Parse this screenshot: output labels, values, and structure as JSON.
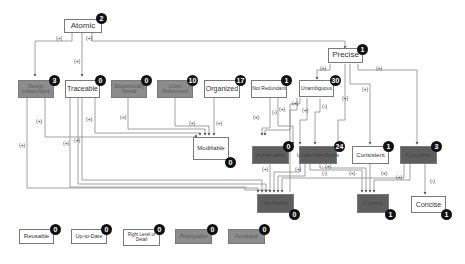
{
  "diagram": {
    "nodes": [
      {
        "id": "atomic",
        "label": "Atomic",
        "count": "2",
        "style": "white"
      },
      {
        "id": "precise",
        "label": "Precise",
        "count": "1",
        "style": "white"
      },
      {
        "id": "design_independent",
        "label": "Design Independent",
        "count": "3",
        "style": "gray"
      },
      {
        "id": "traceable",
        "label": "Traceable",
        "count": "0",
        "style": "white"
      },
      {
        "id": "electronically_stored",
        "label": "Electronically Stored",
        "count": "0",
        "style": "gray"
      },
      {
        "id": "cross_referenced",
        "label": "Cross Referenced",
        "count": "10",
        "style": "gray"
      },
      {
        "id": "organized",
        "label": "Organized",
        "count": "17",
        "style": "white"
      },
      {
        "id": "not_redundant",
        "label": "Not Redundant",
        "count": "1",
        "style": "white"
      },
      {
        "id": "unambiguous",
        "label": "Unambiguous",
        "count": "30",
        "style": "white"
      },
      {
        "id": "modifiable",
        "label": "Modifiable",
        "count": "0",
        "style": "white"
      },
      {
        "id": "achievable",
        "label": "Achievable",
        "count": "0",
        "style": "dark"
      },
      {
        "id": "understandable",
        "label": "Understandable",
        "count": "24",
        "style": "dark"
      },
      {
        "id": "consistent",
        "label": "Consistent",
        "count": "1",
        "style": "white"
      },
      {
        "id": "complete",
        "label": "Complete",
        "count": "3",
        "style": "dark"
      },
      {
        "id": "verifiable",
        "label": "Verifiable",
        "count": "0",
        "style": "dark"
      },
      {
        "id": "correct",
        "label": "Correct",
        "count": "1",
        "style": "dark"
      },
      {
        "id": "concise",
        "label": "Concise",
        "count": "1",
        "style": "white"
      },
      {
        "id": "reusable",
        "label": "Reusable",
        "count": "0",
        "style": "white"
      },
      {
        "id": "up_to_date",
        "label": "Up-to-Date",
        "count": "0",
        "style": "white"
      },
      {
        "id": "right_level_of_detail",
        "label": "Right Level of Detail",
        "count": "0",
        "style": "white"
      },
      {
        "id": "prototypable",
        "label": "Prototypable",
        "count": "0",
        "style": "gray"
      },
      {
        "id": "annotated",
        "label": "Annotated",
        "count": "0",
        "style": "gray"
      }
    ],
    "edges": [
      {
        "from": "atomic",
        "to": "design_independent",
        "sign": "(+)"
      },
      {
        "from": "atomic",
        "to": "traceable",
        "sign": "(+)"
      },
      {
        "from": "atomic",
        "to": "precise",
        "sign": "(+)"
      },
      {
        "from": "precise",
        "to": "unambiguous",
        "sign": "(+)"
      },
      {
        "from": "precise",
        "to": "understandable",
        "sign": "(+)"
      },
      {
        "from": "precise",
        "to": "consistent",
        "sign": "(+)"
      },
      {
        "from": "precise",
        "to": "complete",
        "sign": "(+)"
      },
      {
        "from": "design_independent",
        "to": "modifiable",
        "sign": "(+)"
      },
      {
        "from": "design_independent",
        "to": "verifiable",
        "sign": "(+)"
      },
      {
        "from": "traceable",
        "to": "modifiable",
        "sign": "(+)"
      },
      {
        "from": "traceable",
        "to": "verifiable",
        "sign": "(+)"
      },
      {
        "from": "traceable",
        "to": "correct",
        "sign": "(+)"
      },
      {
        "from": "electronically_stored",
        "to": "modifiable",
        "sign": "(+)"
      },
      {
        "from": "cross_referenced",
        "to": "modifiable",
        "sign": "(+)"
      },
      {
        "from": "organized",
        "to": "modifiable",
        "sign": "(+)"
      },
      {
        "from": "not_redundant",
        "to": "modifiable",
        "sign": "(+)"
      },
      {
        "from": "not_redundant",
        "to": "understandable",
        "sign": "(-)"
      },
      {
        "from": "unambiguous",
        "to": "modifiable",
        "sign": "(+)"
      },
      {
        "from": "unambiguous",
        "to": "understandable",
        "sign": "(+)"
      },
      {
        "from": "unambiguous",
        "to": "understandable",
        "sign": "(-)"
      },
      {
        "from": "unambiguous",
        "to": "verifiable",
        "sign": "(+)"
      },
      {
        "from": "achievable",
        "to": "verifiable",
        "sign": "(+)"
      },
      {
        "from": "understandable",
        "to": "verifiable",
        "sign": "(+)"
      },
      {
        "from": "understandable",
        "to": "correct",
        "sign": "(+)"
      },
      {
        "from": "understandable",
        "to": "correct",
        "sign": "(-)"
      },
      {
        "from": "consistent",
        "to": "correct",
        "sign": "(+)"
      },
      {
        "from": "complete",
        "to": "correct",
        "sign": "(+)"
      },
      {
        "from": "complete",
        "to": "verifiable",
        "sign": "(+)"
      },
      {
        "from": "complete",
        "to": "concise",
        "sign": "(-)"
      }
    ]
  }
}
